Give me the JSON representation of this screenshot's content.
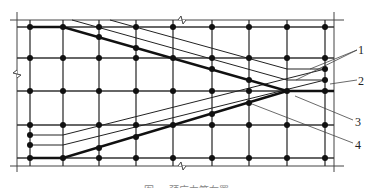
{
  "diagram": {
    "grid": {
      "columns_x": [
        30,
        63,
        99,
        136,
        173,
        212,
        249,
        287,
        325
      ],
      "rows_y": [
        27,
        58,
        91,
        125,
        158
      ],
      "boundary": {
        "left": 17,
        "right": 334,
        "top": 20,
        "bottom": 166
      },
      "line_color": "#333333"
    },
    "labels": [
      {
        "id": "1",
        "text": "1"
      },
      {
        "id": "2",
        "text": "2"
      },
      {
        "id": "3",
        "text": "3"
      },
      {
        "id": "4",
        "text": "4"
      }
    ],
    "caption": "图 — 预应力筋布置"
  }
}
